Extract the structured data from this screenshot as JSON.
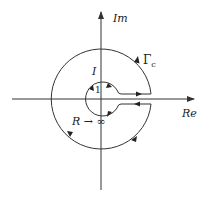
{
  "diagram": {
    "type": "keyhole-contour",
    "axes": {
      "x_label": "Re",
      "y_label": "Im"
    },
    "labels": {
      "contour": "Γ",
      "contour_subscript": "c",
      "inner_path": "I",
      "inner_radius": "1",
      "outer_radius": "R → ∞"
    },
    "colors": {
      "stroke": "#333333",
      "background": "#ffffff"
    }
  }
}
